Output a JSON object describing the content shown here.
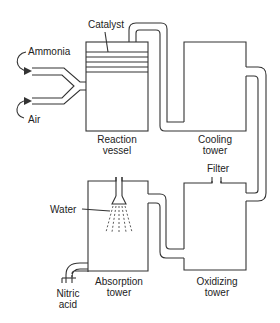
{
  "diagram": {
    "components": {
      "reaction_vessel": {
        "label_line1": "Reaction",
        "label_line2": "vessel"
      },
      "cooling_tower": {
        "label_line1": "Cooling",
        "label_line2": "tower"
      },
      "absorption_tower": {
        "label_line1": "Absorption",
        "label_line2": "tower"
      },
      "oxidizing_tower": {
        "label_line1": "Oxidizing",
        "label_line2": "tower"
      }
    },
    "labels": {
      "catalyst": "Catalyst",
      "ammonia": "Ammonia",
      "air": "Air",
      "filter": "Filter",
      "water": "Water",
      "nitric_acid_line1": "Nitric",
      "nitric_acid_line2": "acid"
    },
    "flow": [
      "Ammonia + Air",
      "Reaction vessel",
      "Cooling tower",
      "Oxidizing tower",
      "Absorption tower",
      "Nitric acid"
    ],
    "colors": {
      "line": "#333333",
      "background": "#ffffff"
    }
  }
}
